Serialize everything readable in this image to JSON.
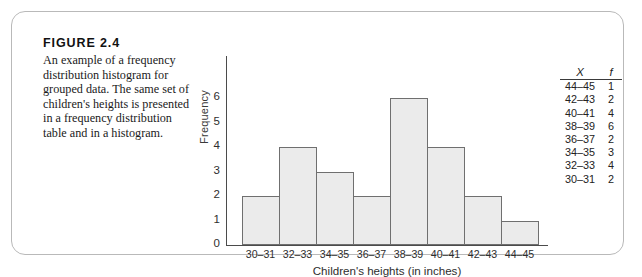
{
  "figure": {
    "number": "FIGURE 2.4",
    "caption": "An example of a frequency distribution histogram for grouped data. The same set of children's heights is presented in a frequency distribution table and in a histogram."
  },
  "table": {
    "headers": [
      "X",
      "f"
    ],
    "rows": [
      {
        "x": "44–45",
        "f": "1"
      },
      {
        "x": "42–43",
        "f": "2"
      },
      {
        "x": "40–41",
        "f": "4"
      },
      {
        "x": "38–39",
        "f": "6"
      },
      {
        "x": "36–37",
        "f": "2"
      },
      {
        "x": "34–35",
        "f": "3"
      },
      {
        "x": "32–33",
        "f": "4"
      },
      {
        "x": "30–31",
        "f": "2"
      }
    ]
  },
  "chart_data": {
    "type": "bar",
    "title": "",
    "xlabel": "Children's heights (in inches)",
    "ylabel": "Frequency",
    "categories": [
      "30–31",
      "32–33",
      "34–35",
      "36–37",
      "38–39",
      "40–41",
      "42–43",
      "44–45"
    ],
    "values": [
      2,
      4,
      3,
      2,
      6,
      4,
      2,
      1
    ],
    "ylim": [
      0,
      6
    ],
    "yticks": [
      "0",
      "1",
      "2",
      "3",
      "4",
      "5",
      "6"
    ],
    "grid": false,
    "legend": false,
    "axis_break": true,
    "bar_fill": "#ebebeb",
    "bar_stroke": "#6f6f6f"
  }
}
